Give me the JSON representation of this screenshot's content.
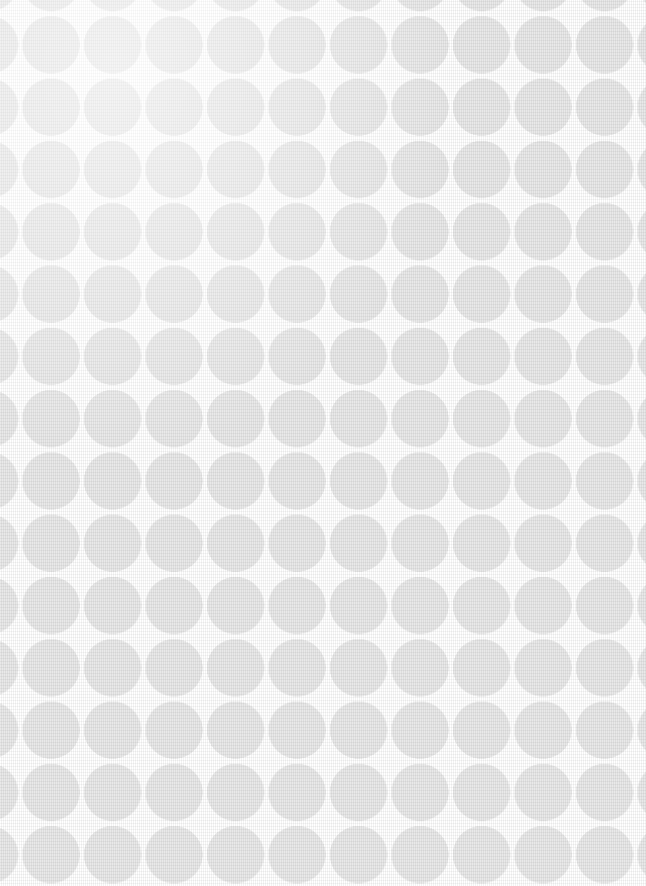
{
  "image": {
    "kind": "decorative-background",
    "subject": "polka-dot patterned woven fabric swatch",
    "width_px": 646,
    "height_px": 886,
    "alt_text": "Seamless grid of pale grey circles on a white woven fabric background",
    "has_text": false,
    "has_ui_controls": false
  },
  "pattern": {
    "name": "circle-grid",
    "arrangement": "square-grid",
    "staggered": false,
    "circle_diameter_px": 57,
    "column_pitch_px": 61.5,
    "row_pitch_px": 62.3,
    "gap_between_circles_px": 4.5,
    "origin_offset_x_px": -39,
    "origin_offset_y_px": -46,
    "columns_visible": 11,
    "rows_visible": 15,
    "edges_clipped": "all-four"
  },
  "colors": {
    "background": "#ffffff",
    "circle_fill": "#e9e9e9",
    "circle_fill_soft_edge": "#ececec",
    "warp_thread": "#f2f2f2",
    "weft_thread": "#f5f5f5",
    "sheen_highlight": "#ffffff"
  },
  "texture": {
    "type": "woven-cloth",
    "warp_direction": "vertical",
    "warp_spacing_px": 2,
    "weft_direction": "horizontal",
    "weft_spacing_px": 3,
    "strength": "very-subtle"
  }
}
